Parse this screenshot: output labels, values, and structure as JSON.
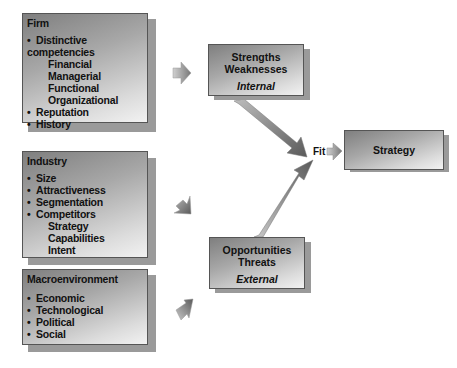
{
  "firm": {
    "title": "Firm",
    "items": [
      {
        "label": "Distinctive competencies",
        "level": 0
      },
      {
        "label": "Financial",
        "level": 1
      },
      {
        "label": "Managerial",
        "level": 1
      },
      {
        "label": "Functional",
        "level": 1
      },
      {
        "label": "Organizational",
        "level": 1
      },
      {
        "label": "Reputation",
        "level": 0
      },
      {
        "label": "History",
        "level": 0
      }
    ]
  },
  "industry": {
    "title": "Industry",
    "items": [
      {
        "label": "Size",
        "level": 0
      },
      {
        "label": "Attractiveness",
        "level": 0
      },
      {
        "label": "Segmentation",
        "level": 0
      },
      {
        "label": "Competitors",
        "level": 0
      },
      {
        "label": "Strategy",
        "level": 1
      },
      {
        "label": "Capabilities",
        "level": 1
      },
      {
        "label": "Intent",
        "level": 1
      }
    ]
  },
  "macro": {
    "title": "Macroenvironment",
    "items": [
      {
        "label": "Economic",
        "level": 0
      },
      {
        "label": "Technological",
        "level": 0
      },
      {
        "label": "Political",
        "level": 0
      },
      {
        "label": "Social",
        "level": 0
      }
    ]
  },
  "internal": {
    "line1": "Strengths",
    "line2": "Weaknesses",
    "label": "Internal"
  },
  "external": {
    "line1": "Opportunities",
    "line2": "Threats",
    "label": "External"
  },
  "fit": {
    "label": "Fit"
  },
  "strategy": {
    "label": "Strategy"
  },
  "colors": {
    "box_dark": "#7f7f7f",
    "box_light": "#f2f2f2",
    "shadow": "#9a9a9a",
    "arrow": "#777777"
  }
}
